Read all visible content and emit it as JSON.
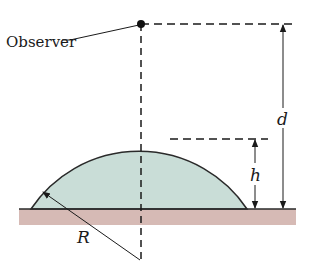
{
  "diagram": {
    "type": "physics-geometry",
    "labels": {
      "observer": "Observer",
      "d": "d",
      "h": "h",
      "R": "R"
    },
    "colors": {
      "dome_fill": "#c9ddd7",
      "dome_stroke": "#2a2a2a",
      "ground_fill": "#d6bab5",
      "ground_line": "#2a2a2a",
      "line": "#1a1a1a"
    },
    "elements": [
      "observer-point",
      "vertical-dashed-axis",
      "top-dashed-reference-line",
      "dome-top-dashed-reference-line",
      "d-dimension-arrow",
      "h-dimension-arrow",
      "R-radius-arrow",
      "dome",
      "ground"
    ]
  }
}
